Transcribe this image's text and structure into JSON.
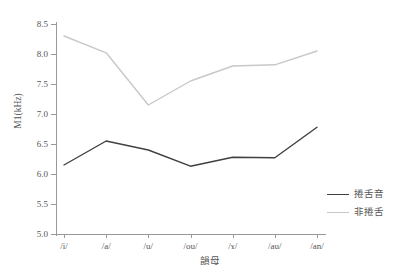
{
  "chart_data": {
    "type": "line",
    "title": "",
    "xlabel": "韻母",
    "ylabel": "M1(kHz)",
    "categories": [
      "/i/",
      "/a/",
      "/u/",
      "/ou/",
      "/ɤ/",
      "/au/",
      "/an/"
    ],
    "ylim": [
      5.0,
      8.5
    ],
    "yticks": [
      "5.0",
      "5.5",
      "6.0",
      "6.5",
      "7.0",
      "7.5",
      "8.0",
      "8.5"
    ],
    "ytick_values": [
      5.0,
      5.5,
      6.0,
      6.5,
      7.0,
      7.5,
      8.0,
      8.5
    ],
    "grid": false,
    "legend_position": "bottom-right",
    "series": [
      {
        "name": "捲舌音",
        "color": "#404040",
        "values": [
          6.15,
          6.55,
          6.4,
          6.13,
          6.28,
          6.27,
          6.78
        ]
      },
      {
        "name": "非捲舌",
        "color": "#c8c8c8",
        "values": [
          8.3,
          8.02,
          7.15,
          7.55,
          7.8,
          7.82,
          8.05
        ]
      }
    ]
  },
  "axes": {
    "y_label": "M1(kHz)",
    "x_label": "韻母"
  },
  "legend": {
    "items": [
      {
        "label": "捲舌音",
        "color": "#404040"
      },
      {
        "label": "非捲舌",
        "color": "#c8c8c8"
      }
    ]
  },
  "colors": {
    "retroflex_line": "#404040",
    "non_retroflex_line": "#c8c8c8",
    "axis": "#999999",
    "text": "#555555",
    "background": "#ffffff"
  }
}
